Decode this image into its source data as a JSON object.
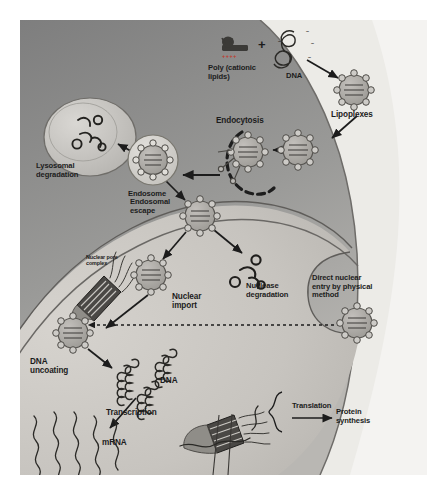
{
  "figure": {
    "background_color": "#eceae6",
    "cytoplasm_color": "#8d8d8d",
    "nucleus_color": "#c9c6c1",
    "outside_color": "#f2f1ef",
    "particle_color": "#a9a7a4",
    "ink_color": "#1c1c1c"
  },
  "labels": {
    "poly_cationic_lipids": "Poly (cationic\nlipids)",
    "plus_sign": "+",
    "dna_top": "DNA",
    "lipoplexes": "Lipoplexes",
    "endocytosis": "Endocytosis",
    "lysosomal_degradation": "Lysosomal\ndegradation",
    "endosome": "Endosome",
    "endosomal_escape": "Endosomal\nescape",
    "nuclease_degradation": "Nuclease\ndegradation",
    "nuclear_pore_complex": "Nuclear pore\ncomplex",
    "nuclear_import": "Nuclear\nimport",
    "direct_nuclear_entry": "Direct nuclear\nentry by physical\nmethod",
    "dna_uncoating": "DNA\nuncoating",
    "dna_nucleus": "DNA",
    "transcription": "Transcription",
    "mrna": "mRNA",
    "translation": "Translation",
    "protein_synthesis": "Protein\nsynthesis"
  },
  "charges": {
    "cationic": "++++",
    "anionic": "–"
  },
  "particles": {
    "lipoplex_count_visible": 8,
    "description": "gray vesicle with internal DNA lines and ring of lipid head groups"
  }
}
